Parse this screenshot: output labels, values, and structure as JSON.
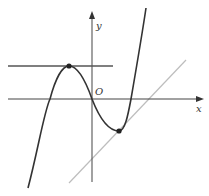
{
  "diagram": {
    "type": "cubic-function-graph",
    "labels": {
      "y_axis": "y",
      "x_axis": "x",
      "origin": "O"
    },
    "elements": {
      "curve": "cubic curve with local maximum and local minimum",
      "horizontal_tangent": "horizontal tangent line through local maximum",
      "slanted_tangent": "gray tangent line through local minimum region"
    },
    "points": [
      {
        "name": "local-maximum",
        "x": 69,
        "y": 66
      },
      {
        "name": "tangent-point",
        "x": 119,
        "y": 131
      }
    ],
    "colors": {
      "curve": "#333333",
      "axes": "#444444",
      "horizontal_line": "#555555",
      "slanted_line": "#bbbbbb",
      "points": "#222222"
    }
  }
}
